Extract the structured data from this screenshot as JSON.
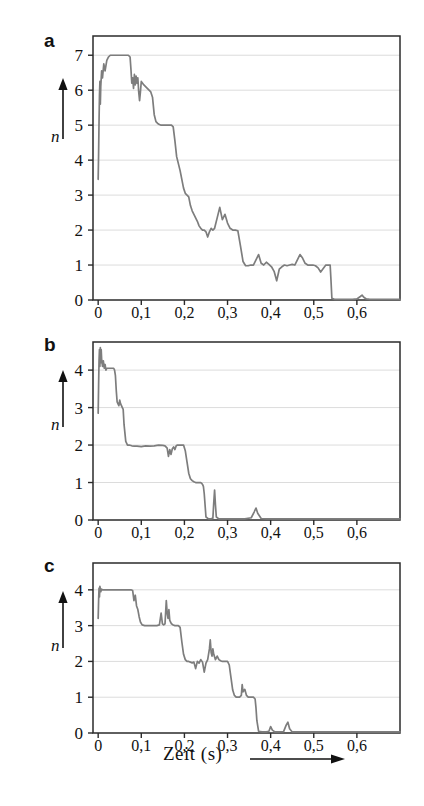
{
  "figure": {
    "background": "#ffffff",
    "curve_color": "#7d7d7d",
    "frame_color": "#2b2b2b",
    "grid_color": "#dcdcdc",
    "xaxis_label": "Zeit (s)",
    "yaxis_symbol": "n",
    "panel_labels": [
      "a",
      "b",
      "c"
    ]
  },
  "chart_data": [
    {
      "type": "line",
      "panel": "a",
      "title": "",
      "xlabel": "Zeit (s)",
      "ylabel": "n",
      "xlim": [
        -0.012,
        0.7
      ],
      "ylim": [
        0,
        7.55
      ],
      "grid": true,
      "legend": "none",
      "xticks": [
        0,
        0.1,
        0.2,
        0.3,
        0.4,
        0.5,
        0.6
      ],
      "xticklabels": [
        "0",
        "0,1",
        "0,2",
        "0,3",
        "0,4",
        "0,5",
        "0,6"
      ],
      "yticks": [
        0,
        1,
        2,
        3,
        4,
        5,
        6,
        7
      ],
      "yticklabels": [
        "0",
        "1",
        "2",
        "3",
        "4",
        "5",
        "6",
        "7"
      ],
      "x": [
        0.0,
        0.001,
        0.002,
        0.003,
        0.004,
        0.005,
        0.006,
        0.008,
        0.01,
        0.013,
        0.016,
        0.02,
        0.024,
        0.028,
        0.032,
        0.038,
        0.044,
        0.05,
        0.056,
        0.062,
        0.066,
        0.07,
        0.074,
        0.076,
        0.078,
        0.08,
        0.082,
        0.084,
        0.086,
        0.088,
        0.09,
        0.092,
        0.094,
        0.096,
        0.098,
        0.1,
        0.103,
        0.106,
        0.11,
        0.114,
        0.118,
        0.122,
        0.126,
        0.13,
        0.134,
        0.138,
        0.142,
        0.146,
        0.15,
        0.154,
        0.158,
        0.162,
        0.166,
        0.17,
        0.174,
        0.178,
        0.182,
        0.186,
        0.19,
        0.194,
        0.198,
        0.202,
        0.206,
        0.21,
        0.214,
        0.218,
        0.222,
        0.226,
        0.23,
        0.234,
        0.238,
        0.242,
        0.246,
        0.25,
        0.254,
        0.258,
        0.262,
        0.266,
        0.27,
        0.276,
        0.282,
        0.288,
        0.294,
        0.3,
        0.306,
        0.312,
        0.318,
        0.324,
        0.33,
        0.336,
        0.342,
        0.348,
        0.354,
        0.36,
        0.366,
        0.372,
        0.378,
        0.384,
        0.39,
        0.396,
        0.402,
        0.408,
        0.414,
        0.42,
        0.426,
        0.432,
        0.438,
        0.444,
        0.45,
        0.456,
        0.462,
        0.468,
        0.474,
        0.48,
        0.486,
        0.492,
        0.498,
        0.504,
        0.51,
        0.516,
        0.522,
        0.528,
        0.534,
        0.538,
        0.54,
        0.542,
        0.548,
        0.56,
        0.575,
        0.59,
        0.6,
        0.608,
        0.612,
        0.616,
        0.622,
        0.63,
        0.64,
        0.65,
        0.66,
        0.67,
        0.68,
        0.69,
        0.7
      ],
      "y": [
        3.45,
        4.2,
        5.1,
        5.85,
        6.25,
        5.6,
        6.1,
        6.55,
        6.35,
        6.75,
        6.55,
        6.85,
        6.95,
        7.0,
        7.0,
        7.0,
        7.0,
        7.0,
        7.0,
        7.0,
        7.0,
        7.0,
        6.95,
        6.6,
        6.2,
        6.35,
        6.05,
        6.45,
        6.15,
        6.4,
        6.2,
        6.35,
        5.95,
        5.7,
        5.95,
        6.25,
        6.2,
        6.15,
        6.1,
        6.05,
        6.0,
        5.95,
        5.8,
        5.3,
        5.1,
        5.05,
        5.02,
        5.0,
        5.0,
        5.0,
        5.0,
        5.0,
        5.0,
        5.0,
        4.95,
        4.55,
        4.1,
        3.9,
        3.7,
        3.45,
        3.2,
        3.05,
        3.0,
        2.95,
        2.7,
        2.55,
        2.45,
        2.35,
        2.25,
        2.12,
        2.05,
        2.0,
        2.0,
        1.95,
        1.8,
        1.95,
        2.05,
        2.0,
        2.05,
        2.35,
        2.65,
        2.3,
        2.45,
        2.2,
        2.05,
        2.0,
        2.0,
        1.98,
        1.55,
        1.1,
        0.98,
        0.98,
        1.0,
        1.0,
        1.15,
        1.3,
        1.05,
        1.0,
        1.08,
        1.02,
        0.95,
        0.82,
        0.55,
        0.88,
        0.95,
        1.0,
        0.98,
        1.0,
        1.02,
        1.0,
        1.15,
        1.3,
        1.2,
        1.05,
        1.0,
        1.0,
        1.0,
        0.98,
        0.92,
        0.8,
        0.9,
        1.0,
        1.0,
        1.0,
        0.55,
        0.05,
        0.02,
        0.02,
        0.02,
        0.02,
        0.03,
        0.1,
        0.14,
        0.08,
        0.03,
        0.02,
        0.02,
        0.02,
        0.02,
        0.02,
        0.02,
        0.02,
        0.02
      ],
      "description": "Stepwise decay from n=7 to n=0 with noisy plateaus at 7, 6, 5, 2 and 1"
    },
    {
      "type": "line",
      "panel": "b",
      "title": "",
      "xlabel": "Zeit (s)",
      "ylabel": "n",
      "xlim": [
        -0.012,
        0.7
      ],
      "ylim": [
        0,
        4.75
      ],
      "grid": true,
      "legend": "none",
      "xticks": [
        0,
        0.1,
        0.2,
        0.3,
        0.4,
        0.5,
        0.6
      ],
      "xticklabels": [
        "0",
        "0,1",
        "0,2",
        "0,3",
        "0,4",
        "0,5",
        "0,6"
      ],
      "yticks": [
        0,
        1,
        2,
        3,
        4
      ],
      "yticklabels": [
        "0",
        "1",
        "2",
        "3",
        "4"
      ],
      "x": [
        0.0,
        0.001,
        0.002,
        0.003,
        0.004,
        0.005,
        0.006,
        0.007,
        0.008,
        0.01,
        0.012,
        0.014,
        0.016,
        0.018,
        0.02,
        0.024,
        0.028,
        0.032,
        0.036,
        0.038,
        0.04,
        0.042,
        0.044,
        0.046,
        0.048,
        0.05,
        0.052,
        0.054,
        0.056,
        0.058,
        0.06,
        0.064,
        0.068,
        0.072,
        0.078,
        0.084,
        0.09,
        0.1,
        0.11,
        0.12,
        0.13,
        0.14,
        0.15,
        0.155,
        0.16,
        0.163,
        0.166,
        0.169,
        0.172,
        0.175,
        0.178,
        0.181,
        0.184,
        0.187,
        0.19,
        0.194,
        0.198,
        0.202,
        0.206,
        0.21,
        0.214,
        0.218,
        0.222,
        0.226,
        0.23,
        0.234,
        0.238,
        0.24,
        0.242,
        0.244,
        0.246,
        0.25,
        0.256,
        0.262,
        0.266,
        0.268,
        0.27,
        0.272,
        0.274,
        0.28,
        0.29,
        0.3,
        0.32,
        0.34,
        0.355,
        0.362,
        0.366,
        0.37,
        0.378,
        0.39,
        0.41,
        0.44,
        0.47,
        0.5,
        0.54,
        0.58,
        0.62,
        0.66,
        0.7
      ],
      "y": [
        2.85,
        3.6,
        4.25,
        4.55,
        4.1,
        4.6,
        4.2,
        4.55,
        4.3,
        4.1,
        4.25,
        4.05,
        4.15,
        4.0,
        4.05,
        4.05,
        4.05,
        4.05,
        4.05,
        4.0,
        3.85,
        3.45,
        3.15,
        3.1,
        3.05,
        3.2,
        3.1,
        3.05,
        3.0,
        2.95,
        2.55,
        2.1,
        2.0,
        2.0,
        1.98,
        1.97,
        1.97,
        1.96,
        1.98,
        1.97,
        1.98,
        2.0,
        1.99,
        1.98,
        1.92,
        1.7,
        1.88,
        1.75,
        1.9,
        1.95,
        1.88,
        1.98,
        2.0,
        2.0,
        2.0,
        2.0,
        2.0,
        1.85,
        1.55,
        1.25,
        1.1,
        1.05,
        1.02,
        1.0,
        1.0,
        1.0,
        1.0,
        0.98,
        0.95,
        0.9,
        0.7,
        0.08,
        0.03,
        0.03,
        0.05,
        0.45,
        0.8,
        0.4,
        0.08,
        0.03,
        0.03,
        0.03,
        0.03,
        0.03,
        0.06,
        0.22,
        0.32,
        0.18,
        0.04,
        0.03,
        0.03,
        0.03,
        0.03,
        0.03,
        0.03,
        0.03,
        0.03,
        0.03,
        0.03
      ],
      "description": "Stepwise decay 4 to 0 finishing near 0.25 s with two isolated spikes at 0.27 and 0.37"
    },
    {
      "type": "line",
      "panel": "c",
      "title": "",
      "xlabel": "Zeit (s)",
      "ylabel": "n",
      "xlim": [
        -0.012,
        0.7
      ],
      "ylim": [
        0,
        4.75
      ],
      "grid": true,
      "legend": "none",
      "xticks": [
        0,
        0.1,
        0.2,
        0.3,
        0.4,
        0.5,
        0.6
      ],
      "xticklabels": [
        "0",
        "0,1",
        "0,2",
        "0,3",
        "0,4",
        "0,5",
        "0,6"
      ],
      "yticks": [
        0,
        1,
        2,
        3,
        4
      ],
      "yticklabels": [
        "0",
        "1",
        "2",
        "3",
        "4"
      ],
      "x": [
        0.0,
        0.001,
        0.002,
        0.003,
        0.004,
        0.006,
        0.008,
        0.01,
        0.014,
        0.02,
        0.03,
        0.04,
        0.05,
        0.06,
        0.07,
        0.076,
        0.08,
        0.083,
        0.086,
        0.089,
        0.092,
        0.095,
        0.098,
        0.102,
        0.108,
        0.114,
        0.12,
        0.128,
        0.136,
        0.142,
        0.146,
        0.149,
        0.152,
        0.155,
        0.158,
        0.16,
        0.162,
        0.164,
        0.166,
        0.17,
        0.174,
        0.178,
        0.182,
        0.186,
        0.19,
        0.194,
        0.198,
        0.202,
        0.206,
        0.21,
        0.214,
        0.218,
        0.222,
        0.226,
        0.23,
        0.234,
        0.238,
        0.242,
        0.246,
        0.25,
        0.254,
        0.258,
        0.26,
        0.262,
        0.264,
        0.266,
        0.268,
        0.272,
        0.276,
        0.28,
        0.284,
        0.288,
        0.292,
        0.296,
        0.3,
        0.304,
        0.308,
        0.312,
        0.316,
        0.32,
        0.324,
        0.328,
        0.332,
        0.334,
        0.336,
        0.34,
        0.344,
        0.348,
        0.352,
        0.356,
        0.36,
        0.364,
        0.366,
        0.368,
        0.372,
        0.38,
        0.39,
        0.396,
        0.4,
        0.404,
        0.41,
        0.42,
        0.43,
        0.436,
        0.44,
        0.444,
        0.45,
        0.46,
        0.48,
        0.51,
        0.54,
        0.58,
        0.62,
        0.66,
        0.7
      ],
      "y": [
        3.2,
        3.7,
        4.05,
        3.8,
        4.1,
        3.95,
        4.02,
        4.0,
        4.0,
        4.0,
        4.0,
        4.0,
        4.0,
        4.0,
        4.0,
        4.0,
        3.98,
        3.7,
        3.85,
        3.55,
        3.45,
        3.25,
        3.1,
        3.02,
        3.0,
        3.0,
        3.0,
        3.0,
        3.0,
        3.02,
        3.35,
        3.05,
        3.02,
        3.05,
        3.7,
        3.35,
        3.2,
        3.45,
        3.15,
        3.05,
        3.02,
        3.0,
        3.0,
        3.0,
        2.95,
        2.55,
        2.2,
        2.05,
        2.0,
        2.0,
        1.98,
        1.96,
        1.98,
        1.8,
        2.0,
        1.95,
        2.05,
        1.98,
        1.7,
        1.95,
        2.05,
        2.35,
        2.6,
        2.25,
        2.15,
        2.35,
        2.2,
        2.05,
        2.15,
        2.05,
        2.02,
        2.0,
        2.0,
        2.0,
        2.0,
        1.9,
        1.55,
        1.2,
        1.05,
        1.0,
        1.0,
        1.0,
        1.05,
        1.35,
        1.15,
        1.22,
        1.05,
        1.0,
        1.0,
        1.0,
        1.0,
        0.95,
        0.7,
        0.35,
        0.05,
        0.03,
        0.03,
        0.05,
        0.18,
        0.08,
        0.03,
        0.03,
        0.04,
        0.22,
        0.3,
        0.12,
        0.03,
        0.03,
        0.03,
        0.03,
        0.03,
        0.03,
        0.03,
        0.03,
        0.03
      ],
      "description": "Stepwise decay 4 to 0 reaching zero near 0.37 s with small spikes at 0.40 and 0.44"
    }
  ]
}
